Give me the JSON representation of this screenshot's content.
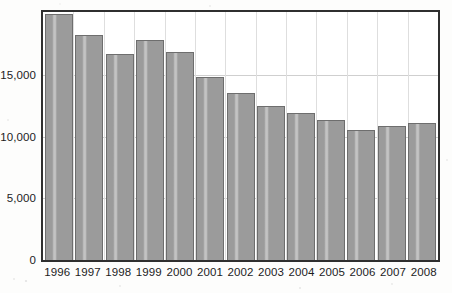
{
  "chart_data": {
    "type": "bar",
    "title": "",
    "xlabel": "",
    "ylabel": "",
    "categories": [
      "1996",
      "1997",
      "1998",
      "1999",
      "2000",
      "2001",
      "2002",
      "2003",
      "2004",
      "2005",
      "2006",
      "2007",
      "2008"
    ],
    "values": [
      20000,
      18300,
      16700,
      17900,
      16900,
      14900,
      13600,
      12500,
      11950,
      11350,
      10600,
      10900,
      11150
    ],
    "ylim": [
      0,
      20150
    ],
    "ytick_values": [
      0,
      5000,
      10000,
      15000
    ],
    "ytick_labels": [
      "0",
      "5,000",
      "10,000",
      "15,000"
    ],
    "grid": "horizontal-and-vertical",
    "legend": "none",
    "colors": {
      "bar_fill": "#9b9b9b",
      "bar_border": "#6e6e6e",
      "axis": "#2f2f2f",
      "gridline": "#cfcfcf",
      "background": "#ffffff",
      "text": "#1c1c1c"
    }
  }
}
